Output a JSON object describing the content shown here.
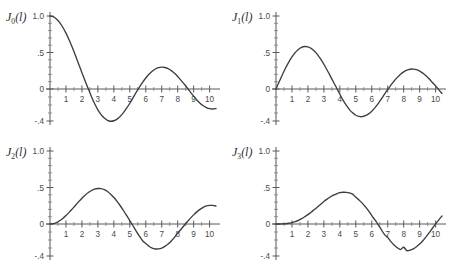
{
  "figure": {
    "background_color": "#ffffff",
    "curve_color": "#3d3d3f",
    "axis_color": "#58595b",
    "panel_count": 4
  },
  "chart_data": [
    {
      "type": "line",
      "title": "J0(l)",
      "label_base": "J",
      "label_order": "0",
      "label_arg": "(l)",
      "xlabel": "",
      "ylabel": "",
      "xlim": [
        0,
        10.4
      ],
      "ylim": [
        -0.4,
        1.0
      ],
      "grid": false,
      "legend": "none",
      "xticks": [
        1,
        2,
        3,
        4,
        5,
        6,
        7,
        8,
        9,
        10
      ],
      "xticklabels": [
        "1",
        "2",
        "3",
        "4",
        "5",
        "6",
        "7",
        "8",
        "9",
        "10"
      ],
      "yticks": [
        1.0,
        0.5,
        0,
        -0.4
      ],
      "yticklabels": [
        "1.0",
        ".5",
        "0",
        "-.4"
      ],
      "x": [
        0,
        0.2,
        0.4,
        0.6,
        0.8,
        1.0,
        1.2,
        1.4,
        1.6,
        1.8,
        2.0,
        2.2,
        2.4,
        2.6,
        2.8,
        3.0,
        3.2,
        3.4,
        3.6,
        3.8,
        4.0,
        4.2,
        4.4,
        4.6,
        4.8,
        5.0,
        5.2,
        5.4,
        5.6,
        5.8,
        6.0,
        6.2,
        6.4,
        6.6,
        6.8,
        7.0,
        7.2,
        7.4,
        7.6,
        7.8,
        8.0,
        8.2,
        8.4,
        8.6,
        8.8,
        9.0,
        9.2,
        9.4,
        9.6,
        9.8,
        10.0,
        10.2,
        10.4
      ],
      "y": [
        1.0,
        0.99,
        0.96,
        0.912,
        0.846,
        0.765,
        0.671,
        0.567,
        0.455,
        0.34,
        0.224,
        0.11,
        0.003,
        -0.097,
        -0.185,
        -0.26,
        -0.32,
        -0.364,
        -0.392,
        -0.403,
        -0.397,
        -0.377,
        -0.342,
        -0.296,
        -0.24,
        -0.178,
        -0.11,
        -0.041,
        0.027,
        0.092,
        0.151,
        0.202,
        0.243,
        0.274,
        0.293,
        0.3,
        0.295,
        0.279,
        0.252,
        0.215,
        0.172,
        0.122,
        0.069,
        0.015,
        -0.039,
        -0.09,
        -0.137,
        -0.177,
        -0.209,
        -0.232,
        -0.246,
        -0.25,
        -0.244
      ],
      "zero_crossings": [
        2.405,
        5.52,
        8.654
      ],
      "extrema": [
        {
          "x": 0.0,
          "y": 1.0,
          "kind": "max"
        },
        {
          "x": 3.83,
          "y": -0.403,
          "kind": "min"
        },
        {
          "x": 7.02,
          "y": 0.3,
          "kind": "max"
        },
        {
          "x": 10.17,
          "y": -0.25,
          "kind": "min"
        }
      ]
    },
    {
      "type": "line",
      "title": "J1(l)",
      "label_base": "J",
      "label_order": "1",
      "label_arg": "(l)",
      "xlabel": "",
      "ylabel": "",
      "xlim": [
        0,
        10.4
      ],
      "ylim": [
        -0.4,
        1.0
      ],
      "grid": false,
      "legend": "none",
      "xticks": [
        1,
        2,
        3,
        4,
        5,
        6,
        7,
        8,
        9,
        10
      ],
      "xticklabels": [
        "1",
        "2",
        "3",
        "4",
        "5",
        "6",
        "7",
        "8",
        "9",
        "10"
      ],
      "yticks": [
        1.0,
        0.5,
        0,
        -0.4
      ],
      "yticklabels": [
        "1.0",
        ".5",
        "0",
        "-.4"
      ],
      "x": [
        0,
        0.2,
        0.4,
        0.6,
        0.8,
        1.0,
        1.2,
        1.4,
        1.6,
        1.8,
        2.0,
        2.2,
        2.4,
        2.6,
        2.8,
        3.0,
        3.2,
        3.4,
        3.6,
        3.8,
        4.0,
        4.2,
        4.4,
        4.6,
        4.8,
        5.0,
        5.2,
        5.4,
        5.6,
        5.8,
        6.0,
        6.2,
        6.4,
        6.6,
        6.8,
        7.0,
        7.2,
        7.4,
        7.6,
        7.8,
        8.0,
        8.2,
        8.4,
        8.6,
        8.8,
        9.0,
        9.2,
        9.4,
        9.6,
        9.8,
        10.0,
        10.2,
        10.4
      ],
      "y": [
        0.0,
        0.1,
        0.196,
        0.287,
        0.369,
        0.44,
        0.498,
        0.542,
        0.57,
        0.582,
        0.577,
        0.556,
        0.52,
        0.471,
        0.41,
        0.339,
        0.261,
        0.179,
        0.095,
        0.013,
        -0.066,
        -0.139,
        -0.203,
        -0.257,
        -0.298,
        -0.328,
        -0.343,
        -0.346,
        -0.334,
        -0.311,
        -0.277,
        -0.233,
        -0.182,
        -0.125,
        -0.065,
        -0.005,
        0.054,
        0.11,
        0.159,
        0.201,
        0.235,
        0.258,
        0.271,
        0.273,
        0.265,
        0.245,
        0.217,
        0.18,
        0.137,
        0.089,
        0.043,
        -0.007,
        -0.057
      ],
      "zero_crossings": [
        3.832,
        7.016,
        10.173
      ],
      "extrema": [
        {
          "x": 1.84,
          "y": 0.582,
          "kind": "max"
        },
        {
          "x": 5.33,
          "y": -0.346,
          "kind": "min"
        },
        {
          "x": 8.54,
          "y": 0.273,
          "kind": "max"
        }
      ]
    },
    {
      "type": "line",
      "title": "J2(l)",
      "label_base": "J",
      "label_order": "2",
      "label_arg": "(l)",
      "xlabel": "",
      "ylabel": "",
      "xlim": [
        0,
        10.4
      ],
      "ylim": [
        -0.4,
        1.0
      ],
      "grid": false,
      "legend": "none",
      "xticks": [
        1,
        2,
        3,
        4,
        5,
        6,
        7,
        8,
        9,
        10
      ],
      "xticklabels": [
        "1",
        "2",
        "3",
        "4",
        "5",
        "6",
        "7",
        "8",
        "9",
        "10"
      ],
      "yticks": [
        1.0,
        0.5,
        0,
        -0.4
      ],
      "yticklabels": [
        "1.0",
        ".5",
        "0",
        "-.4"
      ],
      "x": [
        0,
        0.2,
        0.4,
        0.6,
        0.8,
        1.0,
        1.2,
        1.4,
        1.6,
        1.8,
        2.0,
        2.2,
        2.4,
        2.6,
        2.8,
        3.0,
        3.2,
        3.4,
        3.6,
        3.8,
        4.0,
        4.2,
        4.4,
        4.6,
        4.8,
        5.0,
        5.2,
        5.4,
        5.6,
        5.8,
        6.0,
        6.2,
        6.4,
        6.6,
        6.8,
        7.0,
        7.2,
        7.4,
        7.6,
        7.8,
        8.0,
        8.2,
        8.4,
        8.6,
        8.8,
        9.0,
        9.2,
        9.4,
        9.6,
        9.8,
        10.0,
        10.2,
        10.4
      ],
      "y": [
        0.0,
        0.005,
        0.02,
        0.044,
        0.076,
        0.115,
        0.159,
        0.207,
        0.257,
        0.306,
        0.353,
        0.395,
        0.431,
        0.459,
        0.478,
        0.486,
        0.484,
        0.47,
        0.445,
        0.409,
        0.364,
        0.311,
        0.25,
        0.185,
        0.117,
        0.047,
        -0.022,
        -0.089,
        -0.152,
        -0.21,
        -0.243,
        -0.278,
        -0.301,
        -0.312,
        -0.311,
        -0.301,
        -0.28,
        -0.25,
        -0.212,
        -0.168,
        -0.113,
        -0.068,
        -0.019,
        0.031,
        0.08,
        0.125,
        0.166,
        0.201,
        0.228,
        0.247,
        0.255,
        0.255,
        0.245
      ],
      "zero_crossings": [
        5.136,
        8.417
      ],
      "extrema": [
        {
          "x": 3.05,
          "y": 0.486,
          "kind": "max"
        },
        {
          "x": 6.71,
          "y": -0.313,
          "kind": "min"
        },
        {
          "x": 9.97,
          "y": 0.255,
          "kind": "max"
        }
      ]
    },
    {
      "type": "line",
      "title": "J3(l)",
      "label_base": "J",
      "label_order": "3",
      "label_arg": "(l)",
      "xlabel": "",
      "ylabel": "",
      "xlim": [
        0,
        10.4
      ],
      "ylim": [
        -0.4,
        1.0
      ],
      "grid": false,
      "legend": "none",
      "xticks": [
        1,
        2,
        3,
        4,
        5,
        6,
        7,
        8,
        9,
        10
      ],
      "xticklabels": [
        "1",
        "2",
        "3",
        "4",
        "5",
        "6",
        "7",
        "8",
        "9",
        "10"
      ],
      "yticks": [
        1.0,
        0.5,
        0,
        -0.4
      ],
      "yticklabels": [
        "1.0",
        ".5",
        "0",
        "-.4"
      ],
      "x": [
        0,
        0.2,
        0.4,
        0.6,
        0.8,
        1.0,
        1.2,
        1.4,
        1.6,
        1.8,
        2.0,
        2.2,
        2.4,
        2.6,
        2.8,
        3.0,
        3.2,
        3.4,
        3.6,
        3.8,
        4.0,
        4.2,
        4.4,
        4.6,
        4.8,
        5.0,
        5.2,
        5.4,
        5.6,
        5.8,
        6.0,
        6.2,
        6.4,
        6.6,
        6.8,
        7.0,
        7.2,
        7.4,
        7.6,
        7.8,
        8.0,
        8.2,
        8.4,
        8.6,
        8.8,
        9.0,
        9.2,
        9.4,
        9.6,
        9.8,
        10.0,
        10.2,
        10.4
      ],
      "y": [
        0.0,
        0.0,
        0.001,
        0.004,
        0.01,
        0.02,
        0.033,
        0.05,
        0.073,
        0.1,
        0.129,
        0.162,
        0.198,
        0.234,
        0.271,
        0.309,
        0.341,
        0.37,
        0.395,
        0.414,
        0.43,
        0.435,
        0.434,
        0.426,
        0.41,
        0.365,
        0.33,
        0.286,
        0.236,
        0.181,
        0.115,
        0.055,
        -0.008,
        -0.071,
        -0.132,
        -0.168,
        -0.221,
        -0.263,
        -0.296,
        -0.319,
        -0.291,
        -0.333,
        -0.327,
        -0.31,
        -0.284,
        -0.251,
        -0.209,
        -0.161,
        -0.108,
        -0.053,
        0.002,
        0.057,
        0.11
      ],
      "zero_crossings": [
        6.38,
        9.761
      ],
      "extrema": [
        {
          "x": 4.2,
          "y": 0.435,
          "kind": "max"
        },
        {
          "x": 8.02,
          "y": -0.334,
          "kind": "min"
        }
      ]
    }
  ]
}
